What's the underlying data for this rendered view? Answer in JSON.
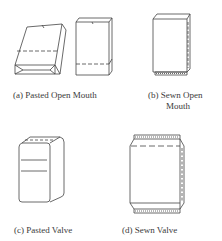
{
  "diagram": {
    "panels": [
      {
        "id": "a",
        "caption": "(a) Pasted Open Mouth",
        "shapes": [
          "pasted-block-bottom-bag",
          "open-mouth-flat-bag"
        ]
      },
      {
        "id": "b",
        "caption_line1": "(b) Sewn Open",
        "caption_line2": "Mouth",
        "shapes": [
          "sewn-open-mouth-bag"
        ]
      },
      {
        "id": "c",
        "caption": "(c) Pasted Valve",
        "shapes": [
          "pasted-valve-bag"
        ]
      },
      {
        "id": "d",
        "caption": "(d) Sewn Valve",
        "shapes": [
          "sewn-valve-bag"
        ]
      }
    ],
    "line_color": "#444444"
  }
}
